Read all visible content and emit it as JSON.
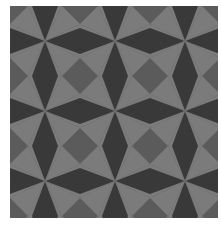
{
  "image": {
    "description": "Geometric tessellation of star/kite shapes in grayscale",
    "colors": {
      "background": "#ffffff",
      "light": "#7b7b7b",
      "dark": "#393939",
      "medium": "#5b5b5b"
    },
    "grid": {
      "period": 70,
      "origin_x": 35,
      "origin_y": 35,
      "lozenge_half_width": 13,
      "square_half_diagonal": 18
    }
  }
}
